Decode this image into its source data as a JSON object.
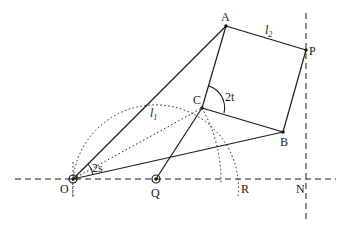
{
  "diagram": {
    "points": {
      "O": {
        "label": "O",
        "x": 73,
        "y": 179
      },
      "Q": {
        "label": "Q",
        "x": 156,
        "y": 179
      },
      "R": {
        "label": "R",
        "x": 238,
        "y": 179
      },
      "N": {
        "label": "N",
        "x": 306,
        "y": 179
      },
      "A": {
        "label": "A",
        "x": 226,
        "y": 26
      },
      "P": {
        "label": "P",
        "x": 306,
        "y": 50
      },
      "B": {
        "label": "B",
        "x": 283,
        "y": 132
      },
      "C": {
        "label": "C",
        "x": 202,
        "y": 108
      }
    },
    "labels": {
      "l1": "l",
      "l1_sub": "1",
      "l2": "l",
      "l2_sub": "2",
      "angle_t": "2t",
      "angle_s": "2s"
    },
    "colors": {
      "stroke": "#1a1a1a",
      "background": "#ffffff"
    }
  }
}
